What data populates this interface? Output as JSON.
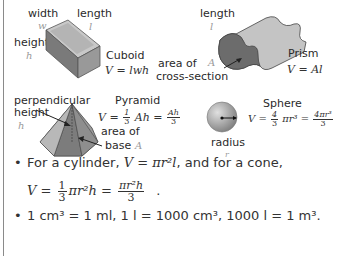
{
  "shapes": {
    "cuboid": {
      "name": "Cuboid",
      "formula": "V = lwh",
      "labels": {
        "width": "width",
        "width_var": "w",
        "length": "length",
        "length_var": "l",
        "height": "height",
        "height_var": "h"
      }
    },
    "prism": {
      "name": "Prism",
      "formula": "V = Al",
      "labels": {
        "length": "length",
        "length_var": "l",
        "area_line1": "area of",
        "area_line2": "cross-section",
        "area_var": "A"
      }
    },
    "pyramid": {
      "name": "Pyramid",
      "formula_prefix": "V =",
      "frac1_num": "1",
      "frac1_den": "3",
      "formula_mid": "Ah =",
      "frac2_num": "Ah",
      "frac2_den": "3",
      "labels": {
        "height_line1": "perpendicular",
        "height_line2": "height",
        "height_var": "h",
        "base_line1": "area of",
        "base_line2": "base",
        "base_var": "A"
      }
    },
    "sphere": {
      "name": "Sphere",
      "formula_prefix": "V =",
      "frac1_num": "4",
      "frac1_den": "3",
      "formula_mid": "πr³ =",
      "frac2_num": "4πr³",
      "frac2_den": "3",
      "labels": {
        "radius": "radius",
        "radius_var": "r"
      }
    }
  },
  "notes": {
    "bullet1_text": "For a cylinder, ",
    "bullet1_formula": "V = πr²l",
    "bullet1_tail": ", and for a cone,",
    "cone_prefix": "V =",
    "cone_frac1_num": "1",
    "cone_frac1_den": "3",
    "cone_mid": "πr²h =",
    "cone_frac2_num": "πr²h",
    "cone_frac2_den": "3",
    "cone_tail": ".",
    "bullet2": "1 cm³ = 1 ml, 1 l = 1000 cm³, 1000 l = 1 m³."
  },
  "colors": {
    "shape_dark": "#6e6e6e",
    "shape_mid": "#9c9c9c",
    "shape_light": "#cfcfcf",
    "var_gray": "#9a9a9a"
  }
}
